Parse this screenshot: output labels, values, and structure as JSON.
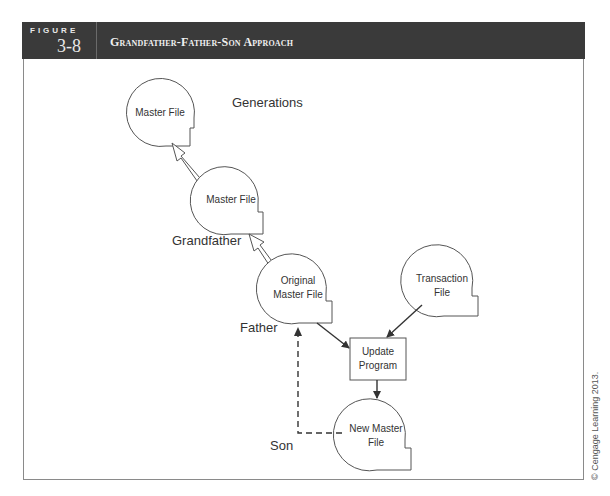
{
  "figure": {
    "label": "FIGURE",
    "number": "3-8",
    "title": "Grandfather-Father-Son Approach"
  },
  "diagram": {
    "nodes": {
      "master_file_top": "Master File",
      "master_file_mid": "Master File",
      "original_master_line1": "Original",
      "original_master_line2": "Master File",
      "transaction_line1": "Transaction",
      "transaction_line2": "File",
      "update_line1": "Update",
      "update_line2": "Program",
      "new_master_line1": "New Master",
      "new_master_line2": "File"
    },
    "labels": {
      "generations": "Generations",
      "grandfather": "Grandfather",
      "father": "Father",
      "son": "Son"
    },
    "colors": {
      "header_bg": "#3a3a3a",
      "stroke": "#555555",
      "text": "#333333"
    }
  },
  "credit": "© Cengage Learning 2013."
}
